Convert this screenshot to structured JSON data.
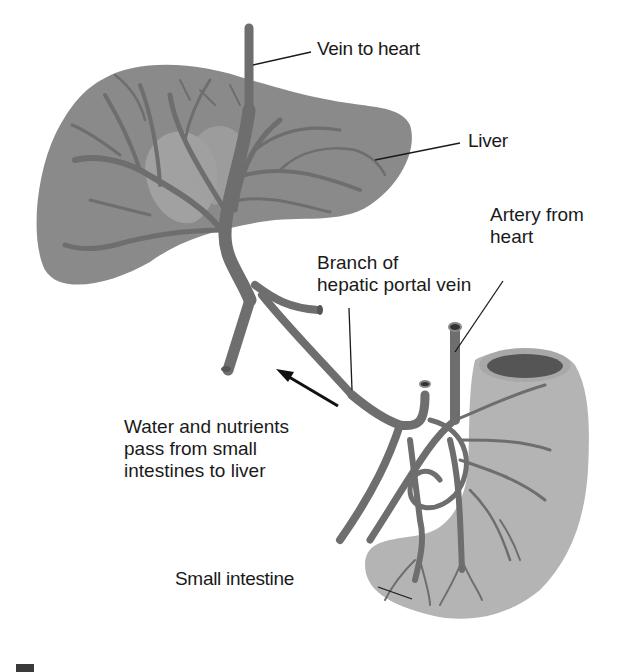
{
  "diagram": {
    "labels": {
      "vein_to_heart": "Vein to heart",
      "liver": "Liver",
      "artery_from_heart": "Artery from\nheart",
      "branch_hepatic_portal": "Branch of\nhepatic portal vein",
      "water_nutrients": "Water and nutrients\npass from small\nintestines to liver",
      "small_intestine": "Small intestine"
    },
    "colors": {
      "liver": "#8a8a8a",
      "liver_light": "#a8a8a8",
      "vessel": "#6e6e6e",
      "intestine": "#b4b4b4",
      "intestine_inner": "#555555",
      "text": "#1a1a1a"
    },
    "arrow": {
      "direction": "up-left",
      "meaning": "flow from intestine to liver"
    }
  }
}
